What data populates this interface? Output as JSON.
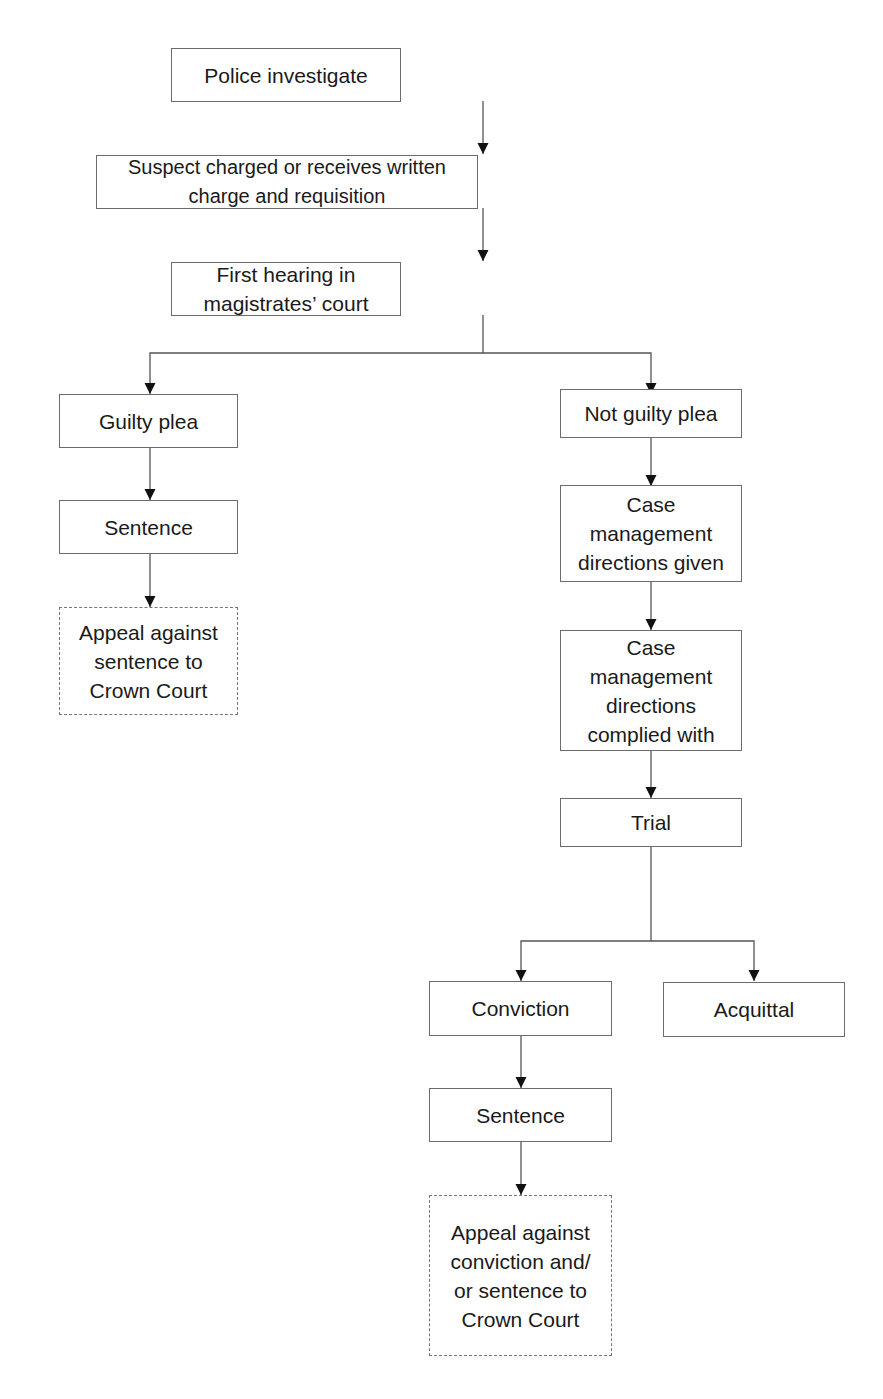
{
  "diagram": {
    "type": "flowchart",
    "nodes": {
      "police": {
        "label": "Police investigate"
      },
      "charged": {
        "label": "Suspect charged or receives written charge and requisition"
      },
      "first_hearing": {
        "label": "First hearing in magistrates’ court"
      },
      "guilty_plea": {
        "label": "Guilty plea"
      },
      "sentence_left": {
        "label": "Sentence"
      },
      "appeal_sentence": {
        "label": "Appeal against sentence to Crown Court",
        "style": "dashed"
      },
      "not_guilty_plea": {
        "label": "Not guilty plea"
      },
      "cm_given": {
        "label": "Case management directions given"
      },
      "cm_complied": {
        "label": "Case management directions complied with"
      },
      "trial": {
        "label": "Trial"
      },
      "conviction": {
        "label": "Conviction"
      },
      "acquittal": {
        "label": "Acquittal"
      },
      "sentence_right": {
        "label": "Sentence"
      },
      "appeal_conviction": {
        "label": "Appeal against conviction and/ or sentence to Crown Court",
        "style": "dashed"
      }
    },
    "edges": [
      [
        "police",
        "charged"
      ],
      [
        "charged",
        "first_hearing"
      ],
      [
        "first_hearing",
        "guilty_plea"
      ],
      [
        "first_hearing",
        "not_guilty_plea"
      ],
      [
        "guilty_plea",
        "sentence_left"
      ],
      [
        "sentence_left",
        "appeal_sentence"
      ],
      [
        "not_guilty_plea",
        "cm_given"
      ],
      [
        "cm_given",
        "cm_complied"
      ],
      [
        "cm_complied",
        "trial"
      ],
      [
        "trial",
        "conviction"
      ],
      [
        "trial",
        "acquittal"
      ],
      [
        "conviction",
        "sentence_right"
      ],
      [
        "sentence_right",
        "appeal_conviction"
      ]
    ]
  }
}
